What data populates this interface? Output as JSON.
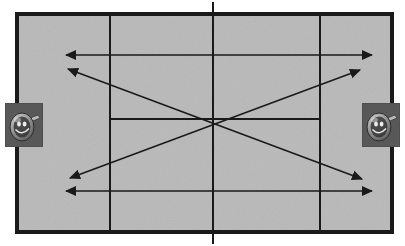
{
  "diagram": {
    "canvas": {
      "width": 405,
      "height": 246,
      "background": "#ffffff"
    }
  },
  "court": {
    "name": "tennis-court",
    "surface_color": "#b9b9b9",
    "line_color": "#1a1a1a",
    "outer_boundary": {
      "x": 17,
      "y": 14,
      "width": 375,
      "height": 218,
      "stroke_width": 4
    },
    "net_line": {
      "x": 213,
      "y_top": 2,
      "y_bottom": 244,
      "stroke_width": 2,
      "label": "net"
    },
    "service_line_left": {
      "x": 110,
      "y_top": 16,
      "y_bottom": 230,
      "stroke_width": 2
    },
    "service_line_right": {
      "x": 320,
      "y_top": 16,
      "y_bottom": 230,
      "stroke_width": 2
    },
    "center_service_line": {
      "y": 119,
      "x_start": 110,
      "x_end": 320,
      "stroke_width": 2
    }
  },
  "arrows": {
    "stroke_color": "#1a1a1a",
    "stroke_width": 1.6,
    "head_color": "#1a1a1a",
    "items": [
      {
        "name": "arrow-top-horizontal",
        "type": "double-headed",
        "orientation": "horizontal",
        "from": {
          "x": 66,
          "y": 55
        },
        "to": {
          "x": 372,
          "y": 55
        }
      },
      {
        "name": "arrow-diagonal-down-right",
        "type": "double-headed",
        "orientation": "diagonal",
        "from": {
          "x": 68,
          "y": 69
        },
        "to": {
          "x": 362,
          "y": 179
        }
      },
      {
        "name": "arrow-diagonal-up-right",
        "type": "double-headed",
        "orientation": "diagonal",
        "from": {
          "x": 70,
          "y": 178
        },
        "to": {
          "x": 360,
          "y": 70
        }
      },
      {
        "name": "arrow-bottom-horizontal",
        "type": "double-headed",
        "orientation": "horizontal",
        "from": {
          "x": 66,
          "y": 191
        },
        "to": {
          "x": 372,
          "y": 191
        }
      }
    ]
  },
  "players": [
    {
      "name": "player-left",
      "side": "left",
      "icon": "tennis-player-icon",
      "thumbnail_background": "#4f4f4f",
      "position": {
        "x": 5,
        "y": 103,
        "width": 38,
        "height": 44
      }
    },
    {
      "name": "player-right",
      "side": "right",
      "icon": "tennis-player-icon",
      "thumbnail_background": "#4f4f4f",
      "position": {
        "x": 362,
        "y": 103,
        "width": 38,
        "height": 44
      }
    }
  ]
}
